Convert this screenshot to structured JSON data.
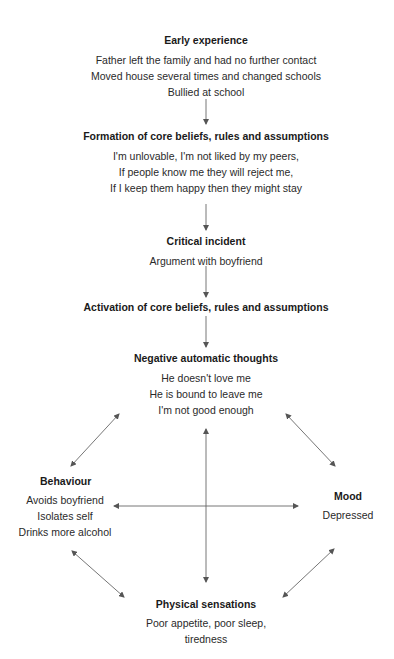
{
  "nodes": {
    "early_experience": {
      "title": "Early experience",
      "lines": [
        "Father left the family and had no further contact",
        "Moved house several times and changed schools",
        "Bullied at school"
      ]
    },
    "core_beliefs": {
      "title": "Formation of core beliefs, rules and assumptions",
      "lines": [
        "I'm unlovable, I'm not liked by my peers,",
        "If people know me they will reject me,",
        "If I keep them happy then they might stay"
      ]
    },
    "critical_incident": {
      "title": "Critical incident",
      "lines": [
        "Argument with boyfriend"
      ]
    },
    "activation": {
      "title": "Activation of core beliefs, rules and assumptions"
    },
    "negative_thoughts": {
      "title": "Negative automatic thoughts",
      "lines": [
        "He doesn't love me",
        "He is bound to leave me",
        "I'm not good enough"
      ]
    },
    "behaviour": {
      "title": "Behaviour",
      "lines": [
        "Avoids boyfriend",
        "Isolates self",
        "Drinks more alcohol"
      ]
    },
    "mood": {
      "title": "Mood",
      "lines": [
        "Depressed"
      ]
    },
    "physical": {
      "title": "Physical sensations",
      "lines": [
        "Poor appetite, poor sleep,",
        "tiredness"
      ]
    }
  },
  "colors": {
    "arrow": "#555555",
    "text": "#1a1a1a"
  }
}
